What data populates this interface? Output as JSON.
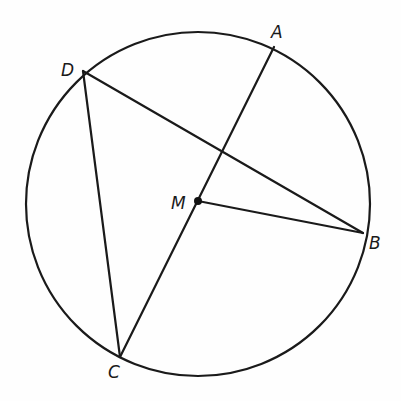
{
  "diagram": {
    "type": "circle-geometry",
    "circle": {
      "center": [
        198,
        204
      ],
      "radius": 172,
      "stroke": "#1a1a1a"
    },
    "points": {
      "A": {
        "label": "A",
        "x": 274,
        "y": 47,
        "lx": 271,
        "ly": 38
      },
      "B": {
        "label": "B",
        "x": 363,
        "y": 233,
        "lx": 369,
        "ly": 249
      },
      "C": {
        "label": "C",
        "x": 120,
        "y": 357,
        "lx": 108,
        "ly": 378
      },
      "D": {
        "label": "D",
        "x": 83,
        "y": 71,
        "lx": 61,
        "ly": 76
      },
      "M": {
        "label": "M",
        "x": 198,
        "y": 201,
        "lx": 171,
        "ly": 209
      }
    },
    "segments": [
      [
        "A",
        "C"
      ],
      [
        "D",
        "B"
      ],
      [
        "D",
        "C"
      ],
      [
        "M",
        "B"
      ]
    ],
    "center_dot": "M"
  }
}
